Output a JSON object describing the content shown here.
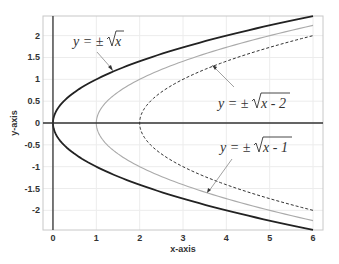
{
  "chart_data": {
    "type": "line",
    "title": "",
    "xlabel": "x-axis",
    "ylabel": "y-axis",
    "xlim": [
      -0.23,
      6.23
    ],
    "ylim": [
      -2.45,
      2.45
    ],
    "grid": true,
    "x_ticks": [
      "0",
      "1",
      "2",
      "3",
      "4",
      "5",
      "6"
    ],
    "y_ticks": [
      "2",
      "1.5",
      "1",
      "0.5",
      "0",
      "-0.5",
      "-1",
      "-1.5",
      "-2"
    ],
    "series": [
      {
        "name": "y = ±√x",
        "shift": 0,
        "style": "solid",
        "color": "#222222",
        "width": 1.8,
        "x": [
          0,
          0.25,
          0.5,
          1,
          2,
          3,
          4,
          5,
          6
        ],
        "y_upper": [
          0,
          0.5,
          0.71,
          1,
          1.41,
          1.73,
          2,
          2.24,
          2.45
        ]
      },
      {
        "name": "y = ±√(x-1)",
        "shift": 1,
        "style": "solid",
        "color": "#aaaaaa",
        "width": 1.1,
        "x": [
          1,
          1.25,
          1.5,
          2,
          3,
          4,
          5,
          6
        ],
        "y_upper": [
          0,
          0.5,
          0.71,
          1,
          1.41,
          1.73,
          2,
          2.24
        ]
      },
      {
        "name": "y = ±√(x-2)",
        "shift": 2,
        "style": "dashed",
        "color": "#333333",
        "width": 1.0,
        "x": [
          2,
          2.25,
          2.5,
          3,
          4,
          5,
          6
        ],
        "y_upper": [
          0,
          0.5,
          0.71,
          1,
          1.41,
          1.73,
          2
        ]
      }
    ],
    "annotations": [
      {
        "prefix": "y = ±",
        "radicand": "x",
        "target_series": 0
      },
      {
        "prefix": "y = ±",
        "radicand": "x - 2",
        "target_series": 2
      },
      {
        "prefix": "y = ±",
        "radicand": "x - 1",
        "target_series": 1
      }
    ]
  }
}
